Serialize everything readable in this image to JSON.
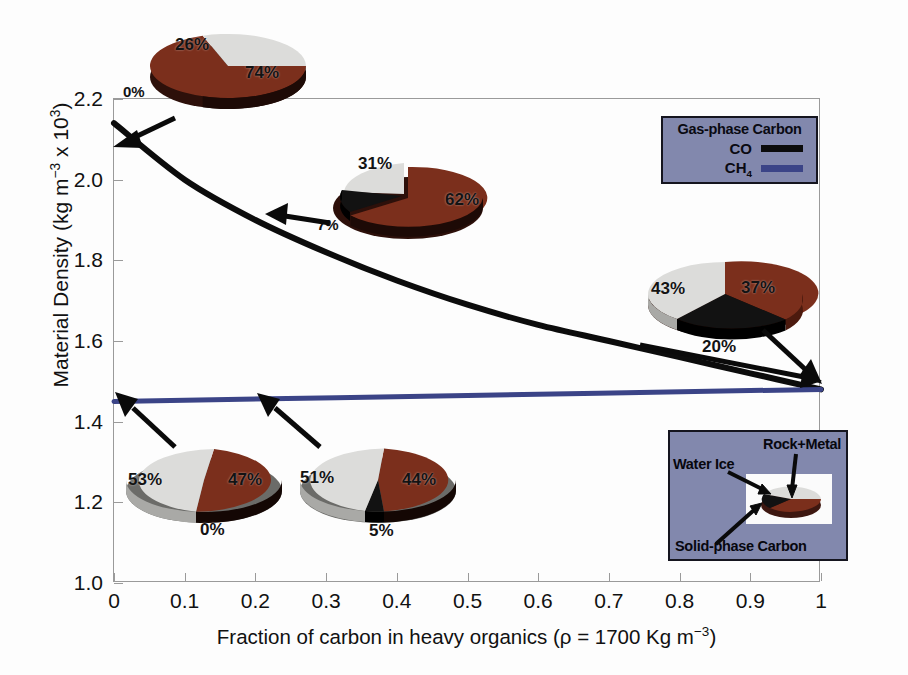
{
  "chart_data": {
    "type": "line",
    "title": "",
    "xlabel": "Fraction of carbon in heavy organics (ρ = 1700 Kg m−3)",
    "ylabel": "Material Density (kg m−3 x 103)",
    "xlim": [
      0,
      1
    ],
    "ylim": [
      1.0,
      2.2
    ],
    "grid": false,
    "xticks": [
      "0",
      "0.1",
      "0.2",
      "0.3",
      "0.4",
      "0.5",
      "0.6",
      "0.7",
      "0.8",
      "0.9",
      "1"
    ],
    "xtick_values": [
      0,
      0.1,
      0.2,
      0.3,
      0.4,
      0.5,
      0.6,
      0.7,
      0.8,
      0.9,
      1.0
    ],
    "yticks": [
      "1.0",
      "1.2",
      "1.4",
      "1.6",
      "1.8",
      "2.0",
      "2.2"
    ],
    "ytick_values": [
      1.0,
      1.2,
      1.4,
      1.6,
      1.8,
      2.0,
      2.2
    ],
    "legend_position": "upper-right",
    "series": [
      {
        "name": "CO",
        "color": "#0c0c0c",
        "x": [
          0.0,
          0.1,
          0.2,
          0.3,
          0.4,
          0.5,
          0.6,
          0.7,
          0.8,
          0.9,
          1.0
        ],
        "values": [
          2.14,
          2.0,
          1.9,
          1.82,
          1.75,
          1.69,
          1.64,
          1.6,
          1.56,
          1.52,
          1.48
        ]
      },
      {
        "name": "CH4",
        "color": "#3b4487",
        "x": [
          0.0,
          0.5,
          1.0
        ],
        "values": [
          1.45,
          1.465,
          1.48
        ]
      }
    ],
    "pies": [
      {
        "id": "pie-co-x0",
        "series": "CO",
        "x_value": 0.0,
        "labels": [
          "Rock+Metal",
          "Water Ice",
          "Solid-phase Carbon"
        ],
        "values": [
          74,
          26,
          0
        ],
        "display": [
          "74%",
          "26%",
          "0%"
        ]
      },
      {
        "id": "pie-co-x02",
        "series": "CO",
        "x_value": 0.2,
        "labels": [
          "Rock+Metal",
          "Water Ice",
          "Solid-phase Carbon"
        ],
        "values": [
          62,
          31,
          7
        ],
        "display": [
          "62%",
          "31%",
          "7%"
        ]
      },
      {
        "id": "pie-converged-x1",
        "series": "CO",
        "x_value": 1.0,
        "labels": [
          "Rock+Metal",
          "Water Ice",
          "Solid-phase Carbon"
        ],
        "values": [
          37,
          43,
          20
        ],
        "display": [
          "37%",
          "43%",
          "20%"
        ]
      },
      {
        "id": "pie-ch4-x0",
        "series": "CH4",
        "x_value": 0.0,
        "labels": [
          "Rock+Metal",
          "Water Ice",
          "Solid-phase Carbon"
        ],
        "values": [
          47,
          53,
          0
        ],
        "display": [
          "47%",
          "53%",
          "0%"
        ]
      },
      {
        "id": "pie-ch4-x02",
        "series": "CH4",
        "x_value": 0.2,
        "labels": [
          "Rock+Metal",
          "Water Ice",
          "Solid-phase Carbon"
        ],
        "values": [
          44,
          51,
          5
        ],
        "display": [
          "44%",
          "51%",
          "5%"
        ]
      }
    ],
    "colors": {
      "rock_metal": "#7b2f1c",
      "rock_metal_side": "#4e1c0f",
      "water_ice": "#dcdcda",
      "water_ice_side": "#a9a9a6",
      "solid_carbon": "#101010",
      "solid_carbon_side": "#000000",
      "co_line": "#0c0c0c",
      "ch4_line": "#3b4487",
      "legend_bg": "#8288ad",
      "frame": "#9a9a9a"
    }
  },
  "axes": {
    "ylabel_pre": "Material Density (kg m",
    "ylabel_sup1": "−3",
    "ylabel_mid": " x 10",
    "ylabel_sup2": "3",
    "ylabel_post": ")",
    "xlabel_pre": "Fraction of carbon in heavy organics (ρ = 1700 Kg m",
    "xlabel_sup": "−3",
    "xlabel_post": ")"
  },
  "legend_gas": {
    "title": "Gas-phase Carbon",
    "co_label": "CO",
    "ch4_label_pre": "CH",
    "ch4_label_sub": "4"
  },
  "legend_pie": {
    "rock_metal": "Rock+Metal",
    "water_ice": "Water Ice",
    "solid_carbon": "Solid-phase Carbon"
  },
  "pie_labels": {
    "p1_rock": "74%",
    "p1_water": "26%",
    "p1_carbon": "0%",
    "p2_rock": "62%",
    "p2_water": "31%",
    "p2_carbon": "7%",
    "p3_rock": "37%",
    "p3_water": "43%",
    "p3_carbon": "20%",
    "p4_rock": "47%",
    "p4_water": "53%",
    "p4_carbon": "0%",
    "p5_rock": "44%",
    "p5_water": "51%",
    "p5_carbon": "5%"
  }
}
